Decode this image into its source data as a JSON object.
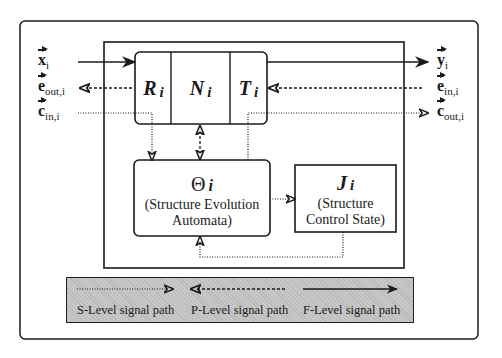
{
  "diagram": {
    "inputs_left": [
      {
        "symbol": "x",
        "subscript": "i",
        "line": "solid",
        "direction": "in"
      },
      {
        "symbol": "e",
        "subscript": "out,i",
        "line": "dashed",
        "direction": "out"
      },
      {
        "symbol": "c",
        "subscript": "in,i",
        "line": "dotted",
        "direction": "in"
      }
    ],
    "outputs_right": [
      {
        "symbol": "y",
        "subscript": "i",
        "line": "solid",
        "direction": "out"
      },
      {
        "symbol": "e",
        "subscript": "in,i",
        "line": "dashed",
        "direction": "in"
      },
      {
        "symbol": "c",
        "subscript": "out,i",
        "line": "dotted",
        "direction": "out"
      }
    ],
    "cells": [
      {
        "symbol": "R",
        "subscript": "i"
      },
      {
        "symbol": "N",
        "subscript": "i"
      },
      {
        "symbol": "T",
        "subscript": "i"
      }
    ],
    "theta_box": {
      "symbol": "Θ",
      "subscript": "i",
      "line1": "(Structure Evolution",
      "line2": "Automata)"
    },
    "j_box": {
      "symbol": "J",
      "subscript": "i",
      "line1": "(Structure",
      "line2": "Control State)"
    },
    "legend": [
      {
        "label": "S-Level signal path",
        "line": "dotted",
        "arrow": "right"
      },
      {
        "label": "P-Level signal path",
        "line": "dashed",
        "arrow": "left"
      },
      {
        "label": "F-Level  signal path",
        "line": "solid",
        "arrow": "right"
      }
    ],
    "colors": {
      "ink": "#1a1a1a",
      "legend_bg": "#c8c8c8",
      "background": "#ffffff"
    }
  }
}
